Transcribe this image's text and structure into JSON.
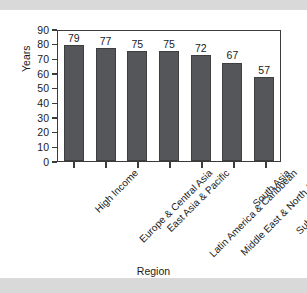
{
  "chart_data": {
    "type": "bar",
    "title": "",
    "xlabel": "Region",
    "ylabel": "Years",
    "ylim": [
      0,
      90
    ],
    "ytick_step": 10,
    "yticks": [
      90,
      80,
      70,
      60,
      50,
      40,
      30,
      20,
      10,
      0
    ],
    "grid": false,
    "legend": null,
    "bar_color": "#555659",
    "categories": [
      "High Income",
      "Europe & Central Asia",
      "East Asia & Pacific",
      "Latin America & Caribbean",
      "Middle East & North Africa",
      "South Asia",
      "Sub-Saharan Africa"
    ],
    "values": [
      79,
      77,
      75,
      75,
      72,
      67,
      57
    ],
    "data_labels": [
      "79",
      "77",
      "75",
      "75",
      "72",
      "67",
      "57"
    ],
    "xtick_label_rotation": -45
  },
  "style": {
    "page_background": "#d9d9d9",
    "panel_background": "#ffffff",
    "axis_color": "#3b3b3b",
    "text_color": "#1a1a1a"
  }
}
